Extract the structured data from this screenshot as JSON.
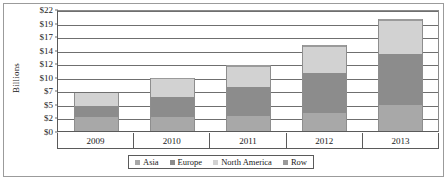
{
  "chart_data": {
    "type": "bar",
    "subtype": "stacked-bar",
    "title": "",
    "xlabel": "",
    "ylabel": "Billions",
    "ylim": [
      0,
      22
    ],
    "grid": true,
    "legend_position": "bottom",
    "categories": [
      "2009",
      "2010",
      "2011",
      "2012",
      "2013"
    ],
    "ytick_labels": [
      "$0",
      "$2",
      "$5",
      "$7",
      "$10",
      "$12",
      "$14",
      "$17",
      "$19",
      "$22"
    ],
    "ytick_values": [
      0,
      2,
      5,
      7,
      10,
      12,
      14,
      17,
      19,
      22
    ],
    "series": [
      {
        "name": "Asia",
        "color": "#a8a8a8",
        "values": [
          2.0,
          2.2,
          2.3,
          3.0,
          4.7
        ]
      },
      {
        "name": "Europe",
        "color": "#8c8c8c",
        "values": [
          2.5,
          3.8,
          5.5,
          7.6,
          8.6
        ]
      },
      {
        "name": "North America",
        "color": "#d2d2d2",
        "values": [
          2.1,
          3.5,
          3.6,
          4.1,
          6.0
        ]
      },
      {
        "name": "Row",
        "color": "#9a9a9a",
        "values": [
          0.0,
          0.2,
          0.3,
          0.3,
          0.4
        ]
      }
    ],
    "totals": [
      6.6,
      9.7,
      11.7,
      15.0,
      19.7
    ]
  },
  "axis": {
    "y_title": "Billions"
  },
  "legend": {
    "items": [
      {
        "label": "Asia",
        "color": "#a8a8a8"
      },
      {
        "label": "Europe",
        "color": "#8c8c8c"
      },
      {
        "label": "North America",
        "color": "#d2d2d2"
      },
      {
        "label": "Row",
        "color": "#9a9a9a"
      }
    ]
  }
}
